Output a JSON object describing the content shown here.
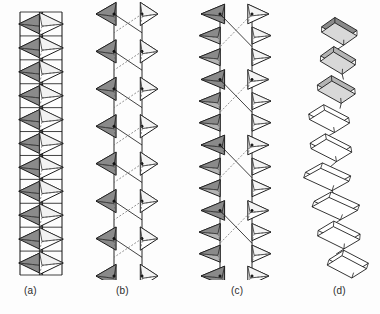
{
  "figure": {
    "background_color": "#fdfdfd",
    "width": 380,
    "height": 314,
    "stroke_color": "#111111",
    "shade_dark": "#8a8a8a",
    "shade_mid": "#b4b4b4",
    "shade_light": "#d8d8d8",
    "shade_white": "#ffffff",
    "dash_color": "#555555"
  },
  "panels": [
    {
      "id": "a",
      "caption": "(a)",
      "polyhedron_type": "tetrahedra",
      "chain_label": "einer double chain",
      "x": 18,
      "width": 46,
      "top": 12,
      "bottom": 275,
      "repeat_count": 11,
      "left_column_shade": "#8a8a8a",
      "right_column_shade": "#ffffff",
      "opening": "none-closed-tight",
      "rail_left_x": 2,
      "rail_right_x": 44
    },
    {
      "id": "b",
      "caption": "(b)",
      "polyhedron_type": "tetrahedra",
      "chain_label": "zweier double chain",
      "x": 96,
      "width": 62,
      "top": 14,
      "bottom": 276,
      "repeat_count": 7,
      "left_column_shade": "#8a8a8a",
      "right_column_shade": "#ffffff",
      "opening": "hexagonal-loops",
      "rail_left_x": 18,
      "rail_right_x": 46
    },
    {
      "id": "c",
      "caption": "(c)",
      "polyhedron_type": "tetrahedra",
      "chain_label": "vierer double chain",
      "x": 196,
      "width": 78,
      "top": 14,
      "bottom": 276,
      "repeat_count": 4,
      "left_column_shade": "#8a8a8a",
      "right_column_shade": "#ffffff",
      "opening": "large-elongated-loops",
      "rail_left_x": 24,
      "rail_right_x": 56
    },
    {
      "id": "d",
      "caption": "(d)",
      "polyhedron_type": "octahedra",
      "chain_label": "irregular octahedral chain",
      "x": 300,
      "width": 76,
      "top": 14,
      "bottom": 276,
      "repeat_count": 9,
      "left_column_shade": "#ffffff",
      "right_column_shade": "#ffffff",
      "shaded_units_at_top": 3,
      "opening": "irregular-kinked"
    }
  ],
  "captions": {
    "a": "(a)",
    "b": "(b)",
    "c": "(c)",
    "d": "(d)"
  }
}
